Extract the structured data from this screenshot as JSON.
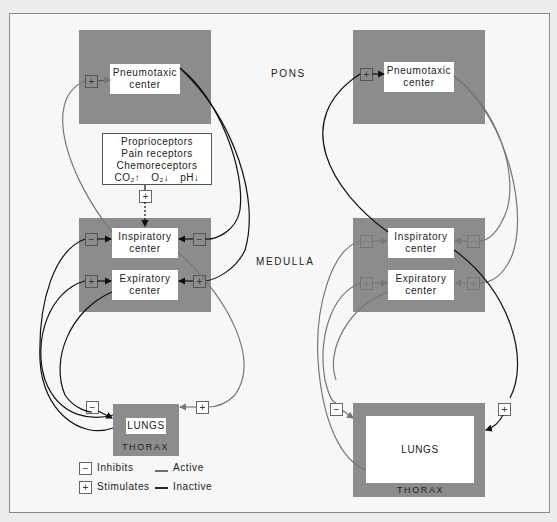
{
  "region_labels": {
    "pons": "PONS",
    "medulla": "MEDULLA"
  },
  "left_panel": {
    "pneumotaxic": {
      "line1": "Pneumotaxic",
      "line2": "center"
    },
    "receptors": {
      "line1": "Proprioceptors",
      "line2": "Pain receptors",
      "line3": "Chemoreceptors",
      "co2": "CO₂↑",
      "o2": "O₂↓",
      "ph": "pH↓"
    },
    "inspiratory": {
      "line1": "Inspiratory",
      "line2": "center"
    },
    "expiratory": {
      "line1": "Expiratory",
      "line2": "center"
    },
    "lungs": "LUNGS",
    "thorax": "THORAX"
  },
  "right_panel": {
    "pneumotaxic": {
      "line1": "Pneumotaxic",
      "line2": "center"
    },
    "inspiratory": {
      "line1": "Inspiratory",
      "line2": "center"
    },
    "expiratory": {
      "line1": "Expiratory",
      "line2": "center"
    },
    "lungs": "LUNGS",
    "thorax": "THORAX"
  },
  "signs": {
    "minus": "−",
    "plus": "+"
  },
  "legend": {
    "inhibits": "Inhibits",
    "stimulates": "Stimulates",
    "active": "Active",
    "inactive": "Inactive"
  },
  "colors": {
    "active": "#111111",
    "inactive": "#777777",
    "center_bg": "#8c8c8c"
  }
}
